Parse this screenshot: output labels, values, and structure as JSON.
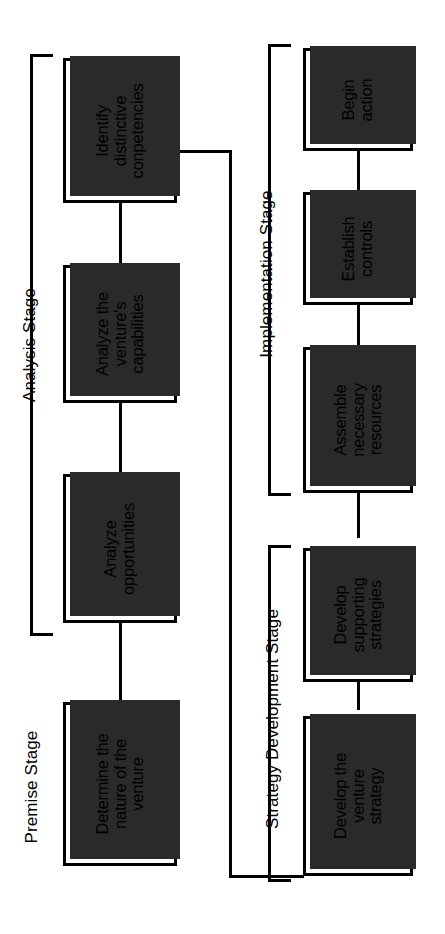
{
  "diagram": {
    "orientation": "rotated-90-counterclockwise",
    "line_color": "#000000",
    "box_fill": "#ffffff",
    "shadow_color": "#2a2a2a"
  },
  "stages": [
    {
      "id": "premise",
      "label": "Premise Stage",
      "has_bracket": false
    },
    {
      "id": "analysis",
      "label": "Analysis Stage",
      "has_bracket": true
    },
    {
      "id": "implementation",
      "label": "Implementation Stage",
      "has_bracket": true
    },
    {
      "id": "strategy",
      "label": "Strategy Development Stage",
      "has_bracket": true
    }
  ],
  "nodes": [
    {
      "id": "n1",
      "stage": "premise",
      "lines": [
        "Determine the",
        "nature of the",
        "venture"
      ]
    },
    {
      "id": "n2",
      "stage": "analysis",
      "lines": [
        "Analyze",
        "opportunities"
      ]
    },
    {
      "id": "n3",
      "stage": "analysis",
      "lines": [
        "Analyze the",
        "venture's",
        "capabilities"
      ]
    },
    {
      "id": "n4",
      "stage": "analysis",
      "lines": [
        "Identify",
        "distinctive",
        "conpetencies"
      ]
    },
    {
      "id": "n5",
      "stage": "strategy",
      "lines": [
        "Develop the",
        "venture",
        "strategy"
      ]
    },
    {
      "id": "n6",
      "stage": "strategy",
      "lines": [
        "Develop",
        "supporting",
        "strategies"
      ]
    },
    {
      "id": "n7",
      "stage": "implementation",
      "lines": [
        "Assemble",
        "necessary",
        "resources"
      ]
    },
    {
      "id": "n8",
      "stage": "implementation",
      "lines": [
        "Establish",
        "controls"
      ]
    },
    {
      "id": "n9",
      "stage": "implementation",
      "lines": [
        "Begin",
        "action"
      ]
    }
  ],
  "edges": [
    {
      "from": "n1",
      "to": "n2"
    },
    {
      "from": "n2",
      "to": "n3"
    },
    {
      "from": "n3",
      "to": "n4"
    },
    {
      "from": "n4",
      "to": "n5"
    },
    {
      "from": "n5",
      "to": "n6"
    },
    {
      "from": "n6",
      "to": "n7"
    },
    {
      "from": "n7",
      "to": "n8"
    },
    {
      "from": "n8",
      "to": "n9"
    }
  ]
}
